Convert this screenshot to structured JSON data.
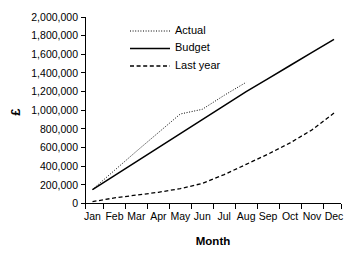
{
  "chart_data": {
    "type": "line",
    "title": "",
    "subtitle": "",
    "xlabel": "Month",
    "ylabel": "£",
    "categories": [
      "Jan",
      "Feb",
      "Mar",
      "Apr",
      "May",
      "Jun",
      "Jul",
      "Aug",
      "Sep",
      "Oct",
      "Nov",
      "Dec"
    ],
    "ylim": [
      0,
      2000000
    ],
    "xlim": [
      0,
      11
    ],
    "yticks": [
      0,
      200000,
      400000,
      600000,
      800000,
      1000000,
      1200000,
      1400000,
      1600000,
      1800000,
      2000000
    ],
    "ytick_labels": [
      "0",
      "200,000",
      "400,000",
      "600,000",
      "800,000",
      "1,000,000",
      "1,200,000",
      "1,400,000",
      "1,600,000",
      "1,800,000",
      "2,000,000"
    ],
    "grid": false,
    "legend_position": "top-center",
    "series": [
      {
        "name": "Actual",
        "style": "dotted",
        "color": "#000000",
        "values": [
          150000,
          355000,
          560000,
          760000,
          960000,
          1010000,
          1160000,
          1300000,
          null,
          null,
          null,
          null
        ]
      },
      {
        "name": "Budget",
        "style": "solid",
        "color": "#000000",
        "values": [
          150000,
          300000,
          450000,
          600000,
          750000,
          900000,
          1050000,
          1200000,
          1340000,
          1480000,
          1620000,
          1760000
        ]
      },
      {
        "name": "Last year",
        "style": "dashed",
        "color": "#000000",
        "values": [
          20000,
          60000,
          90000,
          120000,
          160000,
          215000,
          310000,
          420000,
          530000,
          650000,
          790000,
          970000
        ]
      }
    ]
  },
  "legend": {
    "entries": [
      {
        "label": "Actual"
      },
      {
        "label": "Budget"
      },
      {
        "label": "Last year"
      }
    ]
  },
  "axes": {
    "x_title": "Month",
    "y_title": "£"
  }
}
